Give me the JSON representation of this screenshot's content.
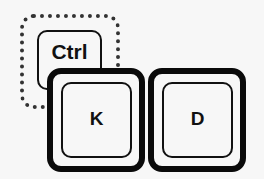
{
  "keys": {
    "ctrl": {
      "label": "Ctrl",
      "style": "dotted-outline"
    },
    "k": {
      "label": "K"
    },
    "d": {
      "label": "D"
    }
  },
  "colors": {
    "stroke": "#0a0a0a",
    "background": "#f7f7f7"
  }
}
